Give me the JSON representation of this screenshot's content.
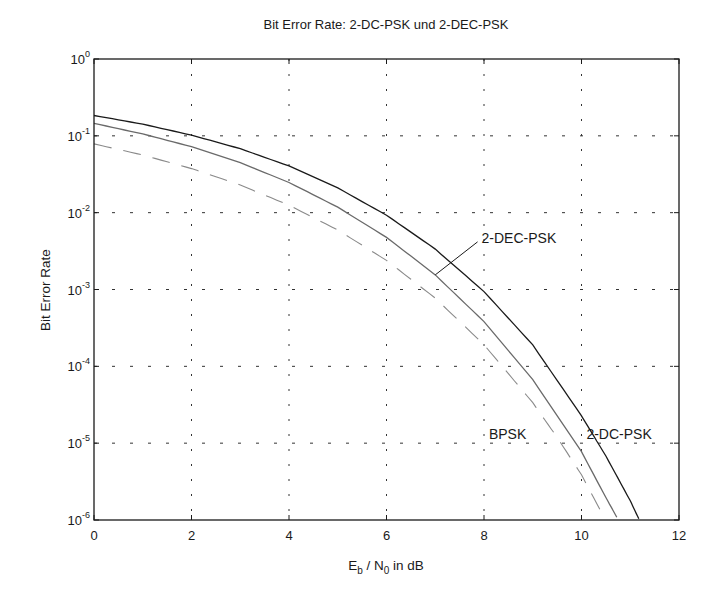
{
  "chart_data": {
    "type": "line",
    "title": "Bit Error Rate: 2-DC-PSK und 2-DEC-PSK",
    "xlabel": "E_b / N_0 in dB",
    "xlabel_parts": {
      "e": "E",
      "e_sub": "b",
      "sep": " / N",
      "n_sub": "0",
      "tail": " in dB"
    },
    "ylabel": "Bit Error Rate",
    "xlim": [
      0,
      12
    ],
    "ylim": [
      1e-06,
      1
    ],
    "yscale": "log",
    "grid": true,
    "legend": "none (inline annotations)",
    "x_ticks": [
      "0",
      "2",
      "4",
      "6",
      "8",
      "10",
      "12"
    ],
    "x_tick_values": [
      0,
      2,
      4,
      6,
      8,
      10,
      12
    ],
    "y_ticks": [
      {
        "base": "10",
        "exp": "0",
        "value": 1
      },
      {
        "base": "10",
        "exp": "-1",
        "value": 0.1
      },
      {
        "base": "10",
        "exp": "-2",
        "value": 0.01
      },
      {
        "base": "10",
        "exp": "-3",
        "value": 0.001
      },
      {
        "base": "10",
        "exp": "-4",
        "value": 0.0001
      },
      {
        "base": "10",
        "exp": "-5",
        "value": 1e-05
      },
      {
        "base": "10",
        "exp": "-6",
        "value": 1e-06
      }
    ],
    "series": [
      {
        "name": "2-DC-PSK",
        "style": "solid",
        "color": "#1a1a1a",
        "x": [
          0,
          1,
          2,
          3,
          4,
          5,
          6,
          7,
          8,
          9,
          10,
          10.5,
          11,
          11.2
        ],
        "values": [
          0.184,
          0.142,
          0.102,
          0.068,
          0.0406,
          0.021,
          0.00927,
          0.00336,
          0.00094,
          0.00019,
          2.27e-05,
          6.8e-06,
          1.78e-06,
          9.6e-07
        ]
      },
      {
        "name": "2-DEC-PSK",
        "style": "solid",
        "color": "#6a6a6a",
        "x": [
          0,
          1,
          2,
          3,
          4,
          5,
          6,
          7,
          8,
          9,
          10,
          10.5,
          10.8
        ],
        "values": [
          0.145,
          0.106,
          0.0722,
          0.0448,
          0.0247,
          0.0118,
          0.00477,
          0.00155,
          0.000382,
          6.72e-05,
          7.74e-06,
          1.96e-06,
          8.9e-07
        ]
      },
      {
        "name": "BPSK",
        "style": "dashed",
        "color": "#8a8a8a",
        "x": [
          0,
          1,
          2,
          3,
          4,
          5,
          6,
          7,
          8,
          9,
          9.5,
          10,
          10.5
        ],
        "values": [
          0.0786,
          0.0563,
          0.0375,
          0.0229,
          0.0125,
          0.00595,
          0.00239,
          0.000773,
          0.000191,
          3.36e-05,
          1.19e-05,
          3.87e-06,
          9.8e-07
        ]
      }
    ],
    "annotations": [
      {
        "text": "2-DEC-PSK",
        "x": 7.95,
        "y": 0.0047,
        "leader_to": {
          "x": 7.0,
          "y": 0.00155
        }
      },
      {
        "text": "BPSK",
        "x": 8.1,
        "y": 1.3e-05
      },
      {
        "text": "2-DC-PSK",
        "x": 10.1,
        "y": 1.3e-05
      }
    ]
  }
}
